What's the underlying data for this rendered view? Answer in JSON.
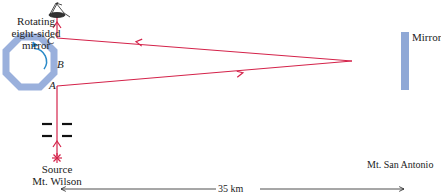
{
  "diagram": {
    "labels": {
      "rotating_mirror_line1": "Rotating",
      "rotating_mirror_line2": "eight-sided",
      "rotating_mirror_line3": "mirror",
      "face_a": "A",
      "face_b": "B",
      "face_c": "C",
      "far_mirror": "Mirror",
      "source_line1": "Source",
      "source_line2": "Mt. Wilson",
      "far_station": "Mt. San Antonio",
      "distance": "35 km"
    },
    "colors": {
      "beam": "#d4234a",
      "mirror_fill": "#8fa8d6",
      "octagon_stroke": "#9ab0dc",
      "rotation_arrow": "#2a8ac8",
      "text": "#222222",
      "slits": "#111111"
    }
  }
}
